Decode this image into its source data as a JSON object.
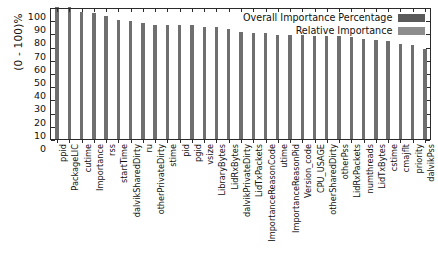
{
  "chart_data": {
    "type": "bar",
    "title": "",
    "subtitle": "",
    "xlabel": "",
    "ylabel": "(0 - 100)%",
    "ylim": [
      0,
      100
    ],
    "yticks": [
      0,
      10,
      20,
      30,
      40,
      50,
      60,
      70,
      80,
      90,
      100
    ],
    "grid": false,
    "legend_position": "top-right",
    "bar_color": "#6f6f6f",
    "legend": [
      {
        "label": "Overall Importance Percentage",
        "color": "#5a5a5a"
      },
      {
        "label": "Relative Importance",
        "color": "#8d8d8d"
      }
    ],
    "categories": [
      "ppid",
      "PackageLIC",
      "cutime",
      "Importance",
      "rss",
      "startTime",
      "dalvikSharedDirty",
      "ru",
      "otherPrivateDirty",
      "stime",
      "pid",
      "pgid",
      "vsize",
      "LibraryBytes",
      "LidRxBytes",
      "dalvikPrivateDirty",
      "LidTxPackets",
      "ImportanceReasonCode",
      "utime",
      "ImportanceReasonPid",
      "Version_code",
      "CPU_USAGE",
      "otherSharedDirty",
      "otherPss",
      "LidRxPackets",
      "numthreads",
      "LidTxBytes",
      "cstime",
      "cmajflt",
      "priority",
      "dalvikPss"
    ],
    "values": [
      100,
      100,
      96,
      95.5,
      93,
      90,
      89.5,
      88,
      86,
      86,
      86,
      86,
      85,
      85,
      83,
      81,
      80,
      80,
      79,
      79,
      79,
      78,
      78,
      78,
      77,
      76,
      75,
      74,
      72,
      71,
      68
    ],
    "series": [
      {
        "name": "Overall Importance Percentage",
        "values": [
          100,
          100,
          96,
          95.5,
          93,
          90,
          89.5,
          88,
          86,
          86,
          86,
          86,
          85,
          85,
          83,
          81,
          80,
          80,
          79,
          79,
          79,
          78,
          78,
          78,
          77,
          76,
          75,
          74,
          72,
          71,
          68
        ]
      }
    ]
  }
}
